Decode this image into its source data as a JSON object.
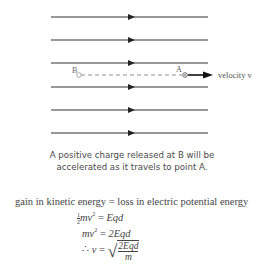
{
  "diagram": {
    "field_lines": [
      {
        "y": 17,
        "x1": 51,
        "x2": 208,
        "arrow_x": 132
      },
      {
        "y": 40,
        "x1": 51,
        "x2": 208,
        "arrow_x": 132
      },
      {
        "y": 63,
        "x1": 51,
        "x2": 208,
        "arrow_x": 132
      },
      {
        "y": 87,
        "x1": 51,
        "x2": 208,
        "arrow_x": 132
      },
      {
        "y": 110,
        "x1": 51,
        "x2": 208,
        "arrow_x": 132
      },
      {
        "y": 133,
        "x1": 51,
        "x2": 208,
        "arrow_x": 132
      }
    ],
    "point_b_label": "B",
    "point_a_label": "A",
    "velocity_label": "velocity v",
    "line_color": "#333333"
  },
  "caption": {
    "line1": "A positive charge released at B will be",
    "line2": "accelerated as it travels to point A."
  },
  "equations": {
    "line1": "gain in kinetic energy = loss in electric potential energy",
    "line2_frac_num": "1",
    "line2_frac_den": "2",
    "line2_lhs": "mv",
    "line2_exp": "2",
    "line2_eq": " = ",
    "line2_rhs": "Eqd",
    "line3_lhs": "mv",
    "line3_exp": "2",
    "line3_eq": " = ",
    "line3_rhs": "2Eqd",
    "line4_therefore": "∴ ",
    "line4_lhs": "v",
    "line4_eq": " = ",
    "line4_sqrt_num": "2Eqd",
    "line4_sqrt_den": "m"
  }
}
